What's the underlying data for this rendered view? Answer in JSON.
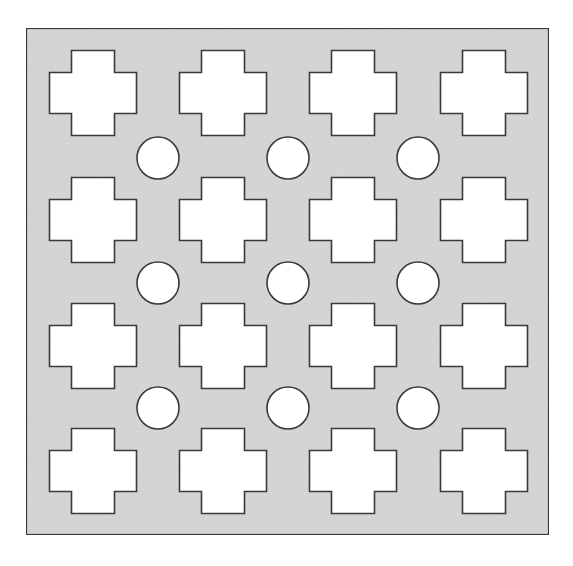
{
  "diagram": {
    "colors": {
      "background": "#ffffff",
      "plate_fill": "#d9d9d9",
      "stroke": "#3a3a3a",
      "hole_fill": "#ffffff"
    },
    "plate": {
      "x": 26,
      "y": 28,
      "width": 523,
      "height": 507,
      "stroke_width": 2.2
    },
    "cross": {
      "total_width": 87,
      "total_height": 85,
      "vertical_arm_width": 43,
      "horizontal_arm_height": 41,
      "stroke_width": 1.6
    },
    "cross_columns_x": [
      93,
      223,
      353,
      484
    ],
    "cross_rows_y": [
      93,
      220,
      346,
      471
    ],
    "circle": {
      "radius": 21,
      "stroke_width": 1.6
    },
    "circle_columns_x": [
      158,
      288,
      418
    ],
    "circle_rows_y": [
      158,
      283,
      408
    ],
    "counts": {
      "crosses": 16,
      "circles": 9
    }
  }
}
